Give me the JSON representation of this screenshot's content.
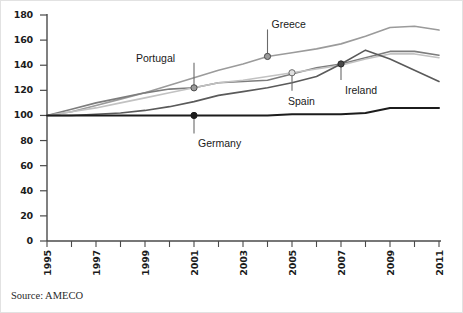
{
  "source_note": "Source: AMECO",
  "chart_data": {
    "type": "line",
    "title": "",
    "xlabel": "",
    "ylabel": "",
    "xlim": [
      1995,
      2011
    ],
    "ylim": [
      0,
      180
    ],
    "ytick_step": 20,
    "grid": false,
    "legend_position": "inline-callouts",
    "yticks": [
      0,
      20,
      40,
      60,
      80,
      100,
      120,
      140,
      160,
      180
    ],
    "x": [
      1995,
      1996,
      1997,
      1998,
      1999,
      2000,
      2001,
      2002,
      2003,
      2004,
      2005,
      2006,
      2007,
      2008,
      2009,
      2010,
      2011
    ],
    "xtick_labels": [
      "1995",
      "",
      "1997",
      "",
      "1999",
      "",
      "2001",
      "",
      "2003",
      "",
      "2005",
      "",
      "2007",
      "",
      "2009",
      "",
      "2011"
    ],
    "xtick_labels_shown": [
      "1995",
      "1997",
      "1999",
      "2001",
      "2003",
      "2005",
      "2007",
      "2009",
      "2011"
    ],
    "series": [
      {
        "name": "Greece",
        "color": "#9b9b9b",
        "values": [
          100,
          103,
          108,
          113,
          118,
          124,
          130,
          136,
          141,
          147,
          150,
          153,
          157,
          163,
          170,
          171,
          168
        ]
      },
      {
        "name": "Portugal",
        "color": "#7d7d7d",
        "values": [
          100,
          105,
          110,
          114,
          118,
          121,
          122,
          126,
          127,
          128,
          133,
          138,
          141,
          146,
          151,
          151,
          148
        ]
      },
      {
        "name": "Spain",
        "color": "#c2c2c2",
        "values": [
          100,
          103,
          106,
          110,
          114,
          118,
          122,
          126,
          128,
          131,
          134,
          137,
          140,
          145,
          149,
          149,
          146
        ]
      },
      {
        "name": "Ireland",
        "color": "#5a5a5a",
        "values": [
          100,
          100,
          101,
          102,
          104,
          107,
          111,
          116,
          119,
          122,
          126,
          131,
          141,
          152,
          145,
          136,
          127
        ]
      },
      {
        "name": "Germany",
        "color": "#1c1c1c",
        "values": [
          100,
          100,
          100,
          100,
          100,
          100,
          100,
          100,
          100,
          100,
          101,
          101,
          101,
          102,
          106,
          106,
          106
        ]
      }
    ],
    "annotations": [
      {
        "label": "Greece",
        "year": 2004,
        "value": 147,
        "marker_fill": "#9b9b9b",
        "marker_stroke": "#4a4a4a",
        "label_dx": 10,
        "label_dy": -30
      },
      {
        "label": "Portugal",
        "year": 2001,
        "value": 122,
        "marker_fill": "#9b9b9b",
        "marker_stroke": "#4a4a4a",
        "label_dx": -58,
        "label_dy": -28
      },
      {
        "label": "Spain",
        "year": 2005,
        "value": 134,
        "marker_fill": "#e0e0e0",
        "marker_stroke": "#6a6a6a",
        "label_dx": -4,
        "label_dy": 28
      },
      {
        "label": "Ireland",
        "year": 2007,
        "value": 141,
        "marker_fill": "#4a4a4a",
        "marker_stroke": "#2a2a2a",
        "label_dx": 5,
        "label_dy": 26
      },
      {
        "label": "Germany",
        "year": 2001,
        "value": 100,
        "marker_fill": "#1c1c1c",
        "marker_stroke": "#1c1c1c",
        "label_dx": 5,
        "label_dy": 28
      }
    ]
  }
}
